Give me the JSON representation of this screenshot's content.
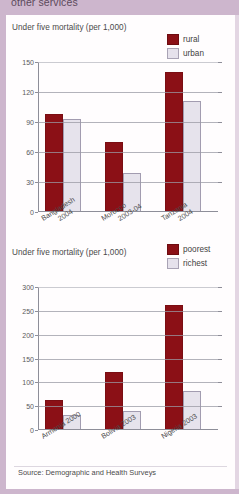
{
  "header": {
    "cut_off_heading": "other services"
  },
  "source_note": "Source: Demographic and Health Surveys",
  "charts": [
    {
      "title": "Under five mortality (per 1,000)",
      "legend": [
        {
          "label": "rural",
          "color": "#8b1016"
        },
        {
          "label": "urban",
          "color": "#e6e3ec"
        }
      ],
      "yticks": [
        "0",
        "30",
        "60",
        "90",
        "120",
        "150"
      ],
      "categories": [
        {
          "line1": "Bangladesh",
          "line2": "2004"
        },
        {
          "line1": "Morocco",
          "line2": "2003-04"
        },
        {
          "line1": "Tanzania",
          "line2": "2004"
        }
      ]
    },
    {
      "title": "Under five mortality (per 1,000)",
      "legend": [
        {
          "label": "poorest",
          "color": "#8b1016"
        },
        {
          "label": "richest",
          "color": "#e6e3ec"
        }
      ],
      "yticks": [
        "0",
        "50",
        "100",
        "150",
        "200",
        "250",
        "300"
      ],
      "categories": [
        {
          "line1": "Armenia 2000"
        },
        {
          "line1": "Bolivia 2003"
        },
        {
          "line1": "Nigeria 2003"
        }
      ]
    }
  ],
  "chart_data": [
    {
      "type": "bar",
      "title": "Under five mortality (per 1,000)",
      "xlabel": "",
      "ylabel": "",
      "ylim": [
        0,
        150
      ],
      "yticks": [
        0,
        30,
        60,
        90,
        120,
        150
      ],
      "grid": true,
      "legend_position": "top-right",
      "categories": [
        "Bangladesh 2004",
        "Morocco 2003-04",
        "Tanzania 2004"
      ],
      "series": [
        {
          "name": "rural",
          "color": "#8b1016",
          "values": [
            97,
            69,
            139
          ]
        },
        {
          "name": "urban",
          "color": "#e6e3ec",
          "values": [
            92,
            38,
            110
          ]
        }
      ],
      "note": "Source: Demographic and Health Surveys"
    },
    {
      "type": "bar",
      "title": "Under five mortality (per 1,000)",
      "xlabel": "",
      "ylabel": "",
      "ylim": [
        0,
        300
      ],
      "yticks": [
        0,
        50,
        100,
        150,
        200,
        250,
        300
      ],
      "grid": true,
      "legend_position": "top-right",
      "categories": [
        "Armenia 2000",
        "Bolivia 2003",
        "Nigeria 2003"
      ],
      "series": [
        {
          "name": "poorest",
          "color": "#8b1016",
          "values": [
            60,
            120,
            260
          ]
        },
        {
          "name": "richest",
          "color": "#e6e3ec",
          "values": [
            30,
            38,
            80
          ]
        }
      ],
      "note": "Source: Demographic and Health Surveys"
    }
  ]
}
